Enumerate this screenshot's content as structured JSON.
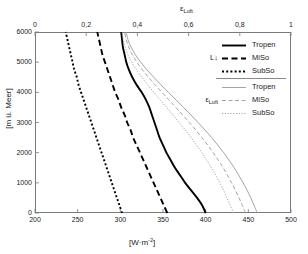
{
  "chart_data": {
    "type": "line",
    "title": "",
    "xlabel": "[W·m⁻²]",
    "xlabel_top": "ε_Luft",
    "ylabel": "[m ü. Meer]",
    "xlim": [
      200,
      500
    ],
    "xlim_top": [
      0,
      1
    ],
    "ylim": [
      0,
      6000
    ],
    "xticks": [
      200,
      250,
      300,
      350,
      400,
      450,
      500
    ],
    "xticks_top": [
      "0",
      "0,2",
      "0,4",
      "0,6",
      "0,8",
      "1"
    ],
    "xticks_top_values": [
      0,
      0.2,
      0.4,
      0.6,
      0.8,
      1
    ],
    "yticks": [
      0,
      1000,
      2000,
      3000,
      4000,
      5000,
      6000
    ],
    "grid": false,
    "legend_position": "upper-right",
    "series": [
      {
        "name": "Tropen",
        "group": "L↓",
        "axis": "bottom",
        "style": "solid",
        "color": "#000000",
        "width": 1.9,
        "points": [
          [
            400,
            0
          ],
          [
            396,
            250
          ],
          [
            390,
            500
          ],
          [
            383,
            750
          ],
          [
            376,
            1000
          ],
          [
            370,
            1250
          ],
          [
            364,
            1500
          ],
          [
            359,
            1750
          ],
          [
            354,
            2000
          ],
          [
            350,
            2250
          ],
          [
            346,
            2500
          ],
          [
            343,
            2750
          ],
          [
            340,
            3000
          ],
          [
            337,
            3250
          ],
          [
            334,
            3500
          ],
          [
            330,
            3750
          ],
          [
            325,
            4000
          ],
          [
            319,
            4250
          ],
          [
            314,
            4500
          ],
          [
            310,
            4750
          ],
          [
            307,
            5000
          ],
          [
            305,
            5250
          ],
          [
            303,
            5500
          ],
          [
            302,
            5750
          ],
          [
            301,
            6000
          ]
        ]
      },
      {
        "name": "MiSo",
        "group": "L↓",
        "axis": "bottom",
        "style": "dashed",
        "color": "#000000",
        "width": 1.9,
        "points": [
          [
            355,
            0
          ],
          [
            351,
            250
          ],
          [
            347,
            500
          ],
          [
            343,
            750
          ],
          [
            339,
            1000
          ],
          [
            335,
            1250
          ],
          [
            331,
            1500
          ],
          [
            327,
            1750
          ],
          [
            323,
            2000
          ],
          [
            319,
            2250
          ],
          [
            315,
            2500
          ],
          [
            312,
            2750
          ],
          [
            308,
            3000
          ],
          [
            305,
            3250
          ],
          [
            301,
            3500
          ],
          [
            298,
            3750
          ],
          [
            294,
            4000
          ],
          [
            291,
            4250
          ],
          [
            288,
            4500
          ],
          [
            285,
            4750
          ],
          [
            282,
            5000
          ],
          [
            279,
            5250
          ],
          [
            277,
            5500
          ],
          [
            275,
            5750
          ],
          [
            273,
            6000
          ]
        ]
      },
      {
        "name": "SubSo",
        "group": "L↓",
        "axis": "bottom",
        "style": "dotted",
        "color": "#000000",
        "width": 1.9,
        "points": [
          [
            302,
            0
          ],
          [
            299,
            250
          ],
          [
            296,
            500
          ],
          [
            293,
            750
          ],
          [
            290,
            1000
          ],
          [
            287,
            1250
          ],
          [
            284,
            1500
          ],
          [
            281,
            1750
          ],
          [
            278,
            2000
          ],
          [
            275,
            2250
          ],
          [
            272,
            2500
          ],
          [
            269,
            2750
          ],
          [
            266,
            3000
          ],
          [
            263,
            3250
          ],
          [
            260,
            3500
          ],
          [
            257,
            3750
          ],
          [
            254,
            4000
          ],
          [
            251,
            4250
          ],
          [
            249,
            4500
          ],
          [
            246,
            4750
          ],
          [
            244,
            5000
          ],
          [
            242,
            5250
          ],
          [
            240,
            5500
          ],
          [
            238,
            5750
          ],
          [
            236,
            6000
          ]
        ]
      },
      {
        "name": "Tropen",
        "group": "ε_Luft",
        "axis": "top",
        "style": "solid",
        "color": "#9a9a9a",
        "width": 0.9,
        "points": [
          [
            0.868,
            0
          ],
          [
            0.856,
            250
          ],
          [
            0.843,
            500
          ],
          [
            0.829,
            750
          ],
          [
            0.813,
            1000
          ],
          [
            0.796,
            1250
          ],
          [
            0.778,
            1500
          ],
          [
            0.758,
            1750
          ],
          [
            0.737,
            2000
          ],
          [
            0.714,
            2250
          ],
          [
            0.69,
            2500
          ],
          [
            0.664,
            2750
          ],
          [
            0.637,
            3000
          ],
          [
            0.609,
            3250
          ],
          [
            0.58,
            3500
          ],
          [
            0.551,
            3750
          ],
          [
            0.521,
            4000
          ],
          [
            0.492,
            4250
          ],
          [
            0.464,
            4500
          ],
          [
            0.437,
            4750
          ],
          [
            0.413,
            5000
          ],
          [
            0.392,
            5250
          ],
          [
            0.375,
            5500
          ],
          [
            0.363,
            5750
          ],
          [
            0.356,
            6000
          ]
        ]
      },
      {
        "name": "MiSo",
        "group": "ε_Luft",
        "axis": "top",
        "style": "dashed",
        "color": "#9a9a9a",
        "width": 0.9,
        "points": [
          [
            0.822,
            0
          ],
          [
            0.81,
            250
          ],
          [
            0.797,
            500
          ],
          [
            0.783,
            750
          ],
          [
            0.768,
            1000
          ],
          [
            0.752,
            1250
          ],
          [
            0.735,
            1500
          ],
          [
            0.716,
            1750
          ],
          [
            0.696,
            2000
          ],
          [
            0.675,
            2250
          ],
          [
            0.652,
            2500
          ],
          [
            0.628,
            2750
          ],
          [
            0.603,
            3000
          ],
          [
            0.577,
            3250
          ],
          [
            0.55,
            3500
          ],
          [
            0.523,
            3750
          ],
          [
            0.496,
            4000
          ],
          [
            0.469,
            4250
          ],
          [
            0.443,
            4500
          ],
          [
            0.419,
            4750
          ],
          [
            0.398,
            5000
          ],
          [
            0.38,
            5250
          ],
          [
            0.366,
            5500
          ],
          [
            0.356,
            5750
          ],
          [
            0.35,
            6000
          ]
        ]
      },
      {
        "name": "SubSo",
        "group": "ε_Luft",
        "axis": "top",
        "style": "dotted",
        "color": "#9a9a9a",
        "width": 0.9,
        "points": [
          [
            0.775,
            0
          ],
          [
            0.763,
            250
          ],
          [
            0.75,
            500
          ],
          [
            0.737,
            750
          ],
          [
            0.722,
            1000
          ],
          [
            0.706,
            1250
          ],
          [
            0.689,
            1500
          ],
          [
            0.671,
            1750
          ],
          [
            0.652,
            2000
          ],
          [
            0.631,
            2250
          ],
          [
            0.61,
            2500
          ],
          [
            0.587,
            2750
          ],
          [
            0.563,
            3000
          ],
          [
            0.539,
            3250
          ],
          [
            0.514,
            3500
          ],
          [
            0.489,
            3750
          ],
          [
            0.464,
            4000
          ],
          [
            0.44,
            4250
          ],
          [
            0.417,
            4500
          ],
          [
            0.396,
            4750
          ],
          [
            0.378,
            5000
          ],
          [
            0.363,
            5250
          ],
          [
            0.352,
            5500
          ],
          [
            0.344,
            5750
          ],
          [
            0.34,
            6000
          ]
        ]
      }
    ],
    "legend": {
      "groups": [
        {
          "tag": "L↓",
          "tag_base": "L",
          "tag_arrow": "↓",
          "entries": [
            {
              "label": "Tropen",
              "style": "solid",
              "color": "#000000"
            },
            {
              "label": "MiSo",
              "style": "dashed",
              "color": "#000000"
            },
            {
              "label": "SubSo",
              "style": "dotted",
              "color": "#000000"
            }
          ]
        },
        {
          "tag": "ε_Luft",
          "tag_base": "ε",
          "tag_sub": "Luft",
          "entries": [
            {
              "label": "Tropen",
              "style": "solid",
              "color": "#9a9a9a"
            },
            {
              "label": "MiSo",
              "style": "dashed",
              "color": "#9a9a9a"
            },
            {
              "label": "SubSo",
              "style": "dotted",
              "color": "#9a9a9a"
            }
          ]
        }
      ]
    }
  },
  "axes": {
    "top_title_base": "ε",
    "top_title_sub": "Luft",
    "bottom_title_base": "[W·m",
    "bottom_title_sup": "-2",
    "bottom_title_end": "]",
    "y_title": "[m ü. Meer]",
    "x_tick_labels": [
      "200",
      "250",
      "300",
      "350",
      "400",
      "450",
      "500"
    ],
    "x_top_tick_labels": [
      "0",
      "0,2",
      "0,4",
      "0,6",
      "0,8",
      "1"
    ],
    "y_tick_labels": [
      "0",
      "1000",
      "2000",
      "3000",
      "4000",
      "5000",
      "6000"
    ]
  },
  "colors": {
    "frame": "#7a7a7a",
    "primary_curve": "#000000",
    "secondary_curve": "#9a9a9a",
    "text": "#1a1a1a",
    "background": "#ffffff"
  }
}
